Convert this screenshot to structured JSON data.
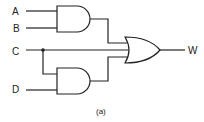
{
  "diagram": {
    "type": "logic-circuit",
    "inputs": [
      {
        "id": "A",
        "label": "A"
      },
      {
        "id": "B",
        "label": "B"
      },
      {
        "id": "C",
        "label": "C"
      },
      {
        "id": "D",
        "label": "D"
      }
    ],
    "output": {
      "id": "W",
      "label": "W"
    },
    "gates": [
      {
        "id": "and1",
        "type": "AND",
        "inputs": [
          "A",
          "B"
        ]
      },
      {
        "id": "and2",
        "type": "AND",
        "inputs": [
          "C",
          "D"
        ]
      },
      {
        "id": "or1",
        "type": "OR",
        "inputs": [
          "and1",
          "C",
          "and2"
        ],
        "output": "W"
      }
    ],
    "expression": "W = AB + C + CD",
    "caption": "(a)",
    "colors": {
      "line": "#222222",
      "background": "#ffffff"
    }
  }
}
